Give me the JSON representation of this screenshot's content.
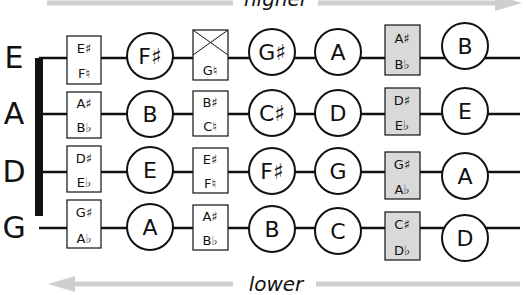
{
  "direction": {
    "top_label": "higher",
    "bottom_label": "lower",
    "arrow_color": "#cfcfcf"
  },
  "colors": {
    "line": "#111111",
    "box_fill_highlight": "#d9d9d9",
    "box_fill_plain": "#ffffff"
  },
  "strings": [
    {
      "name": "E",
      "boxes": [
        {
          "top": "E♯",
          "bottom": "F♮",
          "shaded": false,
          "crossed": false
        },
        {
          "top": "",
          "bottom": "G♮",
          "shaded": false,
          "crossed": true
        },
        {
          "top": "A♯",
          "bottom": "B♭",
          "shaded": true,
          "crossed": false
        }
      ],
      "notes": [
        "F♯",
        "G♯",
        "A",
        "B"
      ]
    },
    {
      "name": "A",
      "boxes": [
        {
          "top": "A♯",
          "bottom": "B♭",
          "shaded": false,
          "crossed": false
        },
        {
          "top": "B♯",
          "bottom": "C♮",
          "shaded": false,
          "crossed": false
        },
        {
          "top": "D♯",
          "bottom": "E♭",
          "shaded": true,
          "crossed": false
        }
      ],
      "notes": [
        "B",
        "C♯",
        "D",
        "E"
      ]
    },
    {
      "name": "D",
      "boxes": [
        {
          "top": "D♯",
          "bottom": "E♭",
          "shaded": false,
          "crossed": false
        },
        {
          "top": "E♯",
          "bottom": "F♮",
          "shaded": false,
          "crossed": false
        },
        {
          "top": "G♯",
          "bottom": "A♭",
          "shaded": true,
          "crossed": false
        }
      ],
      "notes": [
        "E",
        "F♯",
        "G",
        "A"
      ]
    },
    {
      "name": "G",
      "boxes": [
        {
          "top": "G♯",
          "bottom": "A♭",
          "shaded": false,
          "crossed": false
        },
        {
          "top": "A♯",
          "bottom": "B♭",
          "shaded": false,
          "crossed": false
        },
        {
          "top": "C♯",
          "bottom": "D♭",
          "shaded": true,
          "crossed": false
        }
      ],
      "notes": [
        "A",
        "B",
        "C",
        "D"
      ]
    }
  ]
}
